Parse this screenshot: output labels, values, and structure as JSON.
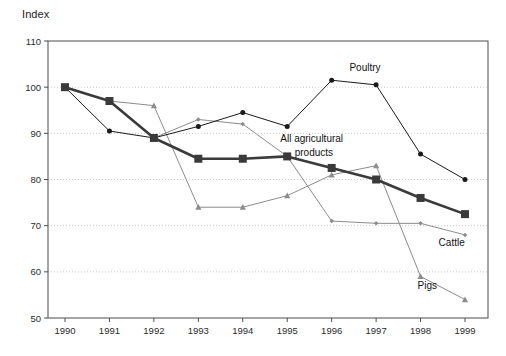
{
  "chart_data": {
    "type": "line",
    "title": "",
    "ylabel": "Index",
    "xlabel": "",
    "grid": "horizontal-dotted",
    "legend_position": "inline-annotations",
    "ylim": [
      50,
      110
    ],
    "ytick_labels": [
      "110",
      "100",
      "90",
      "80",
      "70",
      "60",
      "50"
    ],
    "yticks": [
      110,
      100,
      90,
      80,
      70,
      60,
      50
    ],
    "categories": [
      "1990",
      "1991",
      "1992",
      "1993",
      "1994",
      "1995",
      "1996",
      "1997",
      "1998",
      "1999"
    ],
    "x": [
      1990,
      1991,
      1992,
      1993,
      1994,
      1995,
      1996,
      1997,
      1998,
      1999
    ],
    "series": [
      {
        "name": "All agricultural products",
        "label": "All agricultural\nproducts",
        "label_line1": "All agricultural",
        "label_line2": "products",
        "marker": "square",
        "color": "#3a3a3a",
        "line_width": 2.6,
        "marker_size": 8,
        "values": [
          100,
          97,
          89,
          84.5,
          84.5,
          85,
          82.5,
          80,
          76,
          72.5
        ]
      },
      {
        "name": "Poultry",
        "label": "Poultry",
        "marker": "circle",
        "color": "#1a1a1a",
        "line_width": 1,
        "marker_size": 5,
        "values": [
          100,
          90.5,
          89,
          91.5,
          94.5,
          91.5,
          101.5,
          100.5,
          85.5,
          80
        ]
      },
      {
        "name": "Cattle",
        "label": "Cattle",
        "marker": "diamond",
        "color": "#8c8c8c",
        "line_width": 1,
        "marker_size": 4.5,
        "values": [
          100,
          97,
          89,
          93,
          92,
          85,
          71,
          70.5,
          70.5,
          68
        ]
      },
      {
        "name": "Pigs",
        "label": "Pigs",
        "marker": "triangle",
        "color": "#8c8c8c",
        "line_width": 1,
        "marker_size": 5,
        "values": [
          100,
          97,
          96,
          74,
          74,
          76.5,
          81,
          83,
          59,
          54
        ]
      }
    ],
    "annotations": [
      {
        "text": "Poultry",
        "x": 1996.75,
        "y": 103.5
      },
      {
        "text": "All agricultural",
        "x": 1995.55,
        "y": 88.2
      },
      {
        "text": "products",
        "x": 1995.6,
        "y": 85.1
      },
      {
        "text": "Cattle",
        "x": 1998.7,
        "y": 65.6
      },
      {
        "text": "Pigs",
        "x": 1998.15,
        "y": 56.2
      }
    ]
  }
}
